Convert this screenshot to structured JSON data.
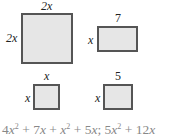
{
  "shapes": {
    "big_square": {
      "top_label": "2x",
      "side_label": "2x"
    },
    "rectangle": {
      "top_label": "7",
      "side_label": "x"
    },
    "small_square_x": {
      "top_label": "x",
      "side_label": "x"
    },
    "small_square_5": {
      "top_label": "5",
      "side_label": "x"
    }
  },
  "formula": {
    "t1_coef": "4",
    "t1_var": "x",
    "t1_exp": "2",
    "op1": " + ",
    "t2_coef": "7",
    "t2_var": "x",
    "op2": " + ",
    "t3_var": "x",
    "t3_exp": "2",
    "op3": " + ",
    "t4_coef": "5",
    "t4_var": "x",
    "sep": "; ",
    "t5_coef": "5",
    "t5_var": "x",
    "t5_exp": "2",
    "op4": " + ",
    "t6_coef": "12",
    "t6_var": "x"
  },
  "colors": {
    "fill": "#e6e6e6",
    "stroke": "#555555",
    "formula_text": "#888888"
  }
}
